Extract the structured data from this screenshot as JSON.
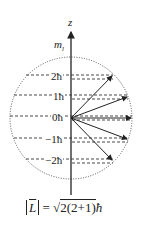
{
  "diagram": {
    "axis_label": "z",
    "quantity_label": "m",
    "quantity_subscript": "l",
    "levels": [
      {
        "label": "2ħ",
        "y": 77,
        "x_end": 113
      },
      {
        "label": "1ħ",
        "y": 97,
        "x_end": 128
      },
      {
        "label": "0ħ",
        "y": 118,
        "x_end": 132
      },
      {
        "label": "−1ħ",
        "y": 140,
        "x_end": 128
      },
      {
        "label": "−2ħ",
        "y": 161,
        "x_end": 113
      }
    ],
    "formula": "|L| = √2(2+1) ħ",
    "formula_parts": {
      "lhs": "L",
      "eq": "=",
      "radicand": "2(2+1)",
      "unit": "ħ"
    },
    "colors": {
      "line": "#222222",
      "circle": "#555555"
    }
  }
}
